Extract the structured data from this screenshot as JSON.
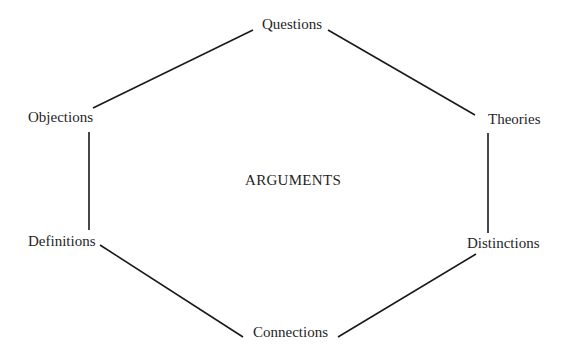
{
  "diagram": {
    "title": "ARGUMENTS",
    "center": {
      "label": "ARGUMENTS"
    },
    "nodes": [
      {
        "id": "questions",
        "label": "Questions"
      },
      {
        "id": "theories",
        "label": "Theories"
      },
      {
        "id": "distinctions",
        "label": "Distinctions"
      },
      {
        "id": "connections",
        "label": "Connections"
      },
      {
        "id": "definitions",
        "label": "Definitions"
      },
      {
        "id": "objections",
        "label": "Objections"
      }
    ],
    "edges": [
      {
        "from": "questions",
        "to": "theories"
      },
      {
        "from": "theories",
        "to": "distinctions"
      },
      {
        "from": "distinctions",
        "to": "connections"
      },
      {
        "from": "connections",
        "to": "definitions"
      },
      {
        "from": "definitions",
        "to": "objections"
      },
      {
        "from": "objections",
        "to": "questions"
      }
    ],
    "colors": {
      "line": "#1a1a1a",
      "text": "#1f1f1f",
      "background": "#ffffff"
    }
  }
}
